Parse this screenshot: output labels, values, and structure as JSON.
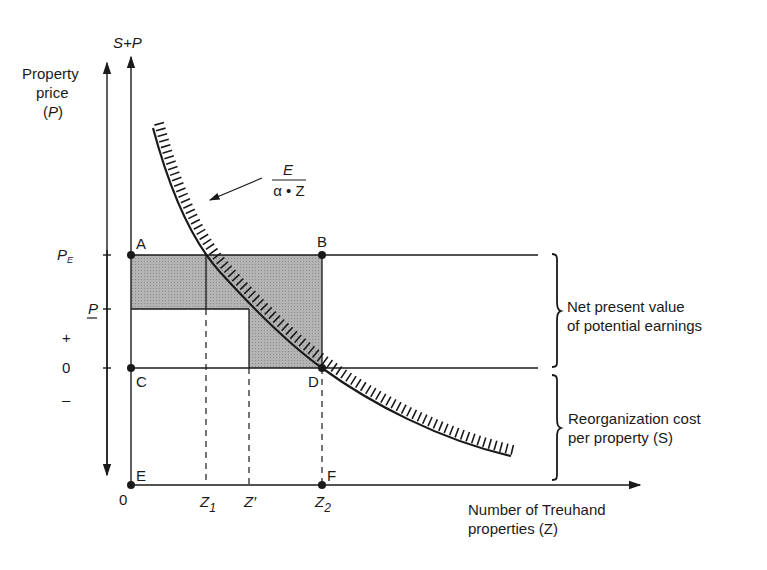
{
  "diagram": {
    "y_axis_outer_label": [
      "Property",
      "price",
      "(P)"
    ],
    "y_axis_outer_label_var": "P",
    "y_axis_inner_label": "S+P",
    "x_axis_label": [
      "Number of Treuhand",
      "properties (Z)"
    ],
    "x_axis_label_var": "Z",
    "curve_label": {
      "numerator": "E",
      "denominator": "α • Z"
    },
    "y_ticks": {
      "pe": "P",
      "pe_sub": "E",
      "p_under": "P",
      "plus": "+",
      "zero": "0",
      "minus": "–"
    },
    "origin": "0",
    "x_ticks": {
      "z1": "Z",
      "z1_sub": "1",
      "zprime": "Z′",
      "z2": "Z",
      "z2_sub": "2"
    },
    "points": {
      "A": "A",
      "B": "B",
      "C": "C",
      "D": "D",
      "E": "E",
      "F": "F"
    },
    "braces": {
      "upper": [
        "Net present value",
        "of potential earnings"
      ],
      "lower": [
        "Reorganization cost",
        "per property (S)"
      ]
    },
    "colors": {
      "shade": "#a8a8a8",
      "line": "#1a1a1a"
    }
  }
}
